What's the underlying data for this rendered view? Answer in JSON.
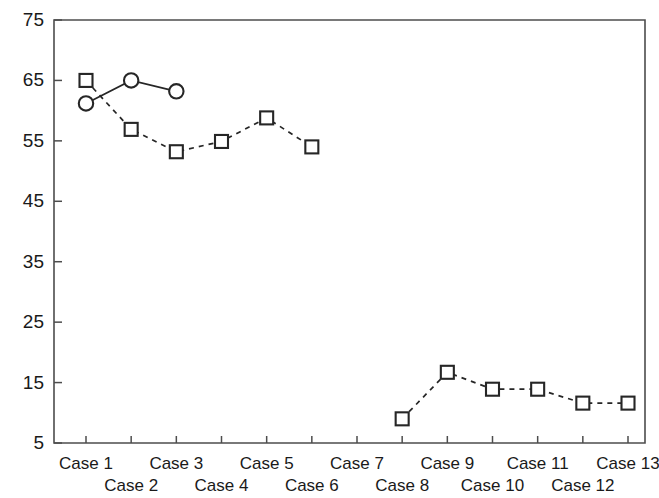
{
  "chart_data": {
    "type": "line",
    "title": "",
    "subtitle": "",
    "xlabel": "",
    "ylabel": "",
    "grid": false,
    "legend_position": "none",
    "categories": [
      "Case 1",
      "Case 2",
      "Case 3",
      "Case 4",
      "Case 5",
      "Case 6",
      "Case 7",
      "Case 8",
      "Case 9",
      "Case 10",
      "Case 11",
      "Case 12",
      "Case 13"
    ],
    "xtick_labels": [
      "Case 1",
      "Case 2",
      "Case 3",
      "Case 4",
      "Case 5",
      "Case 6",
      "Case 7",
      "Case 8",
      "Case 9",
      "Case 10",
      "Case 11",
      "Case 12",
      "Case 13"
    ],
    "ytick_labels": [
      "5",
      "15",
      "25",
      "35",
      "45",
      "55",
      "65",
      "75"
    ],
    "ytick_values": [
      5,
      15,
      25,
      35,
      45,
      55,
      65,
      75
    ],
    "ylim": [
      5,
      75
    ],
    "xlim": [
      0.5,
      13.5
    ],
    "series": [
      {
        "name": "square-series",
        "marker": "square",
        "linestyle": "dashed",
        "color": "#262626",
        "x": [
          "Case 1",
          "Case 2",
          "Case 3",
          "Case 4",
          "Case 5",
          "Case 6",
          "Case 8",
          "Case 9",
          "Case 10",
          "Case 11",
          "Case 12",
          "Case 13"
        ],
        "values": [
          65.0,
          56.9,
          53.2,
          54.9,
          58.8,
          54.0,
          9.0,
          16.7,
          13.9,
          13.9,
          11.6,
          11.6
        ]
      },
      {
        "name": "circle-series",
        "marker": "circle",
        "linestyle": "solid",
        "color": "#262626",
        "x": [
          "Case 1",
          "Case 2",
          "Case 3"
        ],
        "values": [
          61.2,
          65.0,
          63.2
        ]
      }
    ]
  },
  "colors": {
    "axis": "#4d4d4d",
    "marker_stroke": "#262626",
    "marker_fill": "#ffffff",
    "text": "#1a1a1a",
    "background": "#ffffff"
  }
}
